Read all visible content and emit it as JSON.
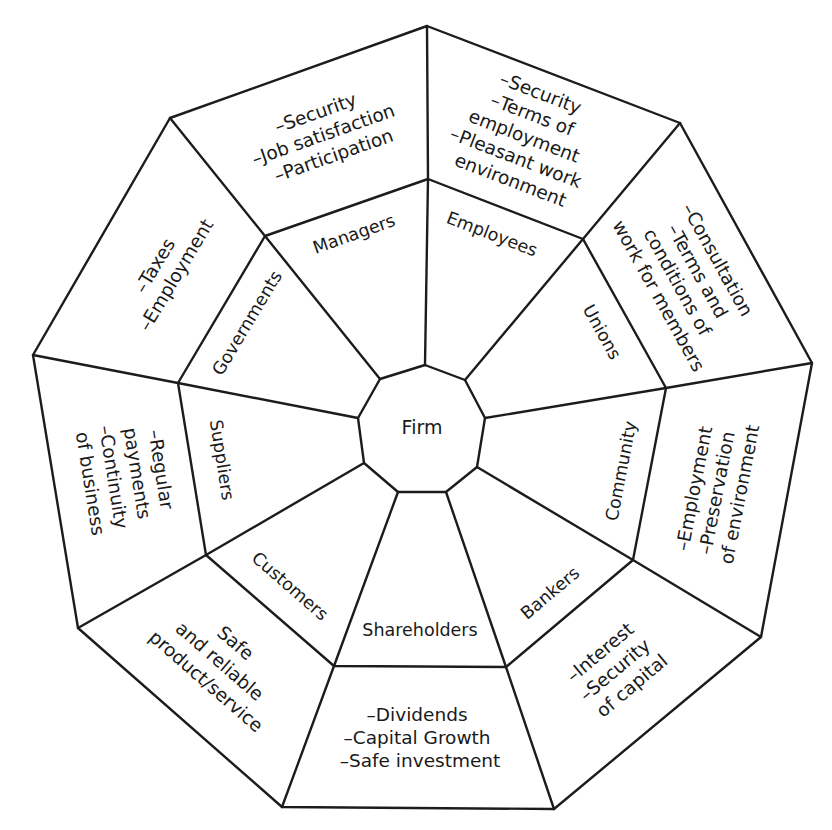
{
  "diagram": {
    "center": {
      "label": "Firm"
    },
    "stakeholders": {
      "managers": {
        "name": "Managers",
        "interests": [
          "–Security",
          "–Job satisfaction",
          "–Participation"
        ]
      },
      "employees": {
        "name": "Employees",
        "interests": [
          "–Security",
          "–Terms of",
          "employment",
          "–Pleasant work",
          "environment"
        ]
      },
      "unions": {
        "name": "Unions",
        "interests": [
          "–Consultation",
          "–Terms and",
          "conditions of",
          "work for members"
        ]
      },
      "community": {
        "name": "Community",
        "interests": [
          "–Employment",
          "–Preservation",
          "of environment"
        ]
      },
      "bankers": {
        "name": "Bankers",
        "interests": [
          "–Interest",
          "–Security",
          "of capital"
        ]
      },
      "shareholders": {
        "name": "Shareholders",
        "interests": [
          "–Dividends",
          "–Capital Growth",
          "–Safe investment"
        ]
      },
      "customers": {
        "name": "Customers",
        "interests": [
          "Safe",
          "and reliable",
          "product/service"
        ]
      },
      "suppliers": {
        "name": "Suppliers",
        "interests": [
          "–Regular",
          "payments",
          "–Continuity",
          "of business"
        ]
      },
      "governments": {
        "name": "Governments",
        "interests": [
          "–Taxes",
          "–Employment"
        ]
      }
    },
    "colors": {
      "line": "#1c1c1c",
      "text": "#1a1a1a",
      "background": "#ffffff"
    }
  }
}
